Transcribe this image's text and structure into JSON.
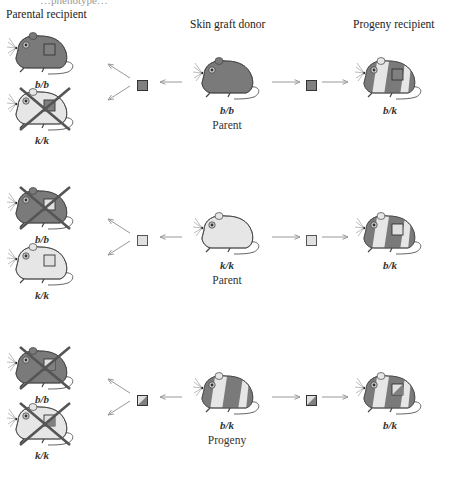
{
  "header": {
    "cut_text": "…phenotype…",
    "col_parental": "Parental recipient",
    "col_donor": "Skin graft donor",
    "col_progeny": "Progeny recipient"
  },
  "colors": {
    "dark_mouse": "#7a7a7a",
    "light_mouse": "#e6e6e6",
    "outline": "#444444",
    "reject_x": "#555555",
    "arrow": "#999999",
    "graft_dark": "#808080",
    "graft_light": "#e0e0e0"
  },
  "rows": [
    {
      "donor": {
        "genotype": "b/b",
        "role": "Parent",
        "coat": "dark"
      },
      "graft": "dark",
      "recipients": [
        {
          "genotype": "b/b",
          "coat": "dark",
          "rejected": false
        },
        {
          "genotype": "k/k",
          "coat": "light",
          "rejected": true
        }
      ],
      "progeny": {
        "genotype": "b/k",
        "coat": "mixed",
        "rejected": false
      }
    },
    {
      "donor": {
        "genotype": "k/k",
        "role": "Parent",
        "coat": "light"
      },
      "graft": "light",
      "recipients": [
        {
          "genotype": "b/b",
          "coat": "dark",
          "rejected": true
        },
        {
          "genotype": "k/k",
          "coat": "light",
          "rejected": false
        }
      ],
      "progeny": {
        "genotype": "b/k",
        "coat": "mixed",
        "rejected": false
      }
    },
    {
      "donor": {
        "genotype": "b/k",
        "role": "Progeny",
        "coat": "mixed"
      },
      "graft": "mixed",
      "recipients": [
        {
          "genotype": "b/b",
          "coat": "dark",
          "rejected": true
        },
        {
          "genotype": "k/k",
          "coat": "light",
          "rejected": true
        }
      ],
      "progeny": {
        "genotype": "b/k",
        "coat": "mixed",
        "rejected": false
      }
    }
  ]
}
